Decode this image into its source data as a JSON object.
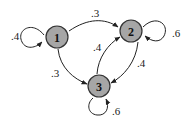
{
  "diagram": {
    "type": "markov-chain-state-diagram",
    "nodes": [
      {
        "id": "1",
        "label": "1",
        "fill": "#a6a6a6"
      },
      {
        "id": "2",
        "label": "2",
        "fill": "#a6a6a6"
      },
      {
        "id": "3",
        "label": "3",
        "fill": "#a6a6a6"
      }
    ],
    "edges": [
      {
        "from": "1",
        "to": "1",
        "label": ".4"
      },
      {
        "from": "1",
        "to": "2",
        "label": ".3"
      },
      {
        "from": "1",
        "to": "3",
        "label": ".3"
      },
      {
        "from": "2",
        "to": "2",
        "label": ".6"
      },
      {
        "from": "2",
        "to": "3",
        "label": ".4"
      },
      {
        "from": "3",
        "to": "2",
        "label": ".4"
      },
      {
        "from": "3",
        "to": "3",
        "label": ".6"
      }
    ]
  }
}
